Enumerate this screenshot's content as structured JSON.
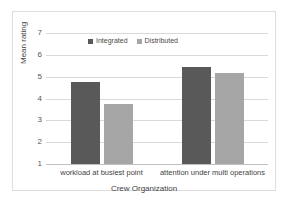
{
  "chart_data": {
    "type": "bar",
    "title": "",
    "xlabel": "Crew Organization",
    "ylabel": "Mean rating",
    "categories": [
      "workload at busiest point",
      "attention under multi operations"
    ],
    "series": [
      {
        "name": "Integrated",
        "values": [
          4.75,
          5.45
        ],
        "color": "#595959"
      },
      {
        "name": "Distributed",
        "values": [
          3.75,
          5.15
        ],
        "color": "#a6a6a6"
      }
    ],
    "ylim": [
      1,
      7
    ],
    "yticks": [
      "7",
      "6",
      "5",
      "4",
      "3",
      "2",
      "1"
    ],
    "grid": true,
    "legend_position": "top-left-inside"
  },
  "legend": {
    "items": [
      {
        "label": "Integrated",
        "color": "#595959"
      },
      {
        "label": "Distributed",
        "color": "#a6a6a6"
      }
    ]
  },
  "colors": {
    "integrated": "#595959",
    "distributed": "#a6a6a6",
    "gridline": "#d9d9d9",
    "border": "#dedede",
    "background": "#ffffff"
  }
}
